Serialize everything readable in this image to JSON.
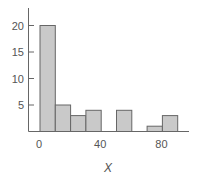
{
  "chart_data": {
    "type": "bar",
    "subtype": "histogram",
    "title": "",
    "xlabel": "X",
    "ylabel": "",
    "bin_width": 10,
    "bins": [
      {
        "start": 0,
        "end": 10,
        "count": 20
      },
      {
        "start": 10,
        "end": 20,
        "count": 5
      },
      {
        "start": 20,
        "end": 30,
        "count": 3
      },
      {
        "start": 30,
        "end": 40,
        "count": 4
      },
      {
        "start": 40,
        "end": 50,
        "count": 0
      },
      {
        "start": 50,
        "end": 60,
        "count": 4
      },
      {
        "start": 60,
        "end": 70,
        "count": 0
      },
      {
        "start": 70,
        "end": 80,
        "count": 1
      },
      {
        "start": 80,
        "end": 90,
        "count": 3
      }
    ],
    "categories": [
      "0-10",
      "10-20",
      "20-30",
      "30-40",
      "40-50",
      "50-60",
      "60-70",
      "70-80",
      "80-90"
    ],
    "values": [
      20,
      5,
      3,
      4,
      0,
      4,
      0,
      1,
      3
    ],
    "xticks": [
      0,
      40,
      80
    ],
    "xtick_labels": [
      "0",
      "40",
      "80"
    ],
    "yticks": [
      5,
      10,
      15,
      20
    ],
    "ytick_labels": [
      "5",
      "10",
      "15",
      "20"
    ],
    "xlim": [
      -7,
      97
    ],
    "ylim": [
      0,
      23
    ],
    "grid": false,
    "legend": null
  },
  "style": {
    "bar_fill": "#c9c9c9",
    "bar_stroke": "#666666",
    "axis_color": "#666666",
    "text_color": "#555555"
  }
}
